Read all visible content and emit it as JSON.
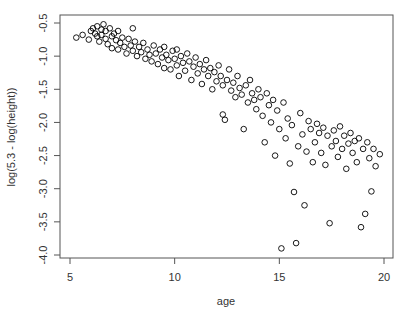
{
  "chart_data": {
    "type": "scatter",
    "title": "",
    "xlabel": "age",
    "ylabel": "log(5.3 - log(height))",
    "xlim": [
      4.75,
      20.3
    ],
    "ylim": [
      -4.05,
      -0.4
    ],
    "xticks": [
      5,
      10,
      15,
      20
    ],
    "xtick_labels": [
      "5",
      "10",
      "15",
      "20"
    ],
    "yticks": [
      -0.5,
      -1.0,
      -1.5,
      -2.0,
      -2.5,
      -3.0,
      -3.5,
      -4.0
    ],
    "ytick_labels": [
      "-0.5",
      "-1.0",
      "-1.5",
      "-2.0",
      "-2.5",
      "-3.0",
      "-3.5",
      "-4.0"
    ],
    "grid": false,
    "legend": null,
    "marker": "open-circle",
    "marker_color": "#000000",
    "trend": "decreasing, spread increases with age",
    "series": [
      {
        "name": "observations",
        "points": [
          [
            5.3,
            -0.72
          ],
          [
            5.6,
            -0.68
          ],
          [
            5.9,
            -0.75
          ],
          [
            6.0,
            -0.62
          ],
          [
            6.1,
            -0.58
          ],
          [
            6.2,
            -0.66
          ],
          [
            6.3,
            -0.55
          ],
          [
            6.3,
            -0.7
          ],
          [
            6.4,
            -0.78
          ],
          [
            6.5,
            -0.6
          ],
          [
            6.5,
            -0.68
          ],
          [
            6.6,
            -0.52
          ],
          [
            6.7,
            -0.74
          ],
          [
            6.7,
            -0.62
          ],
          [
            6.8,
            -0.82
          ],
          [
            6.9,
            -0.58
          ],
          [
            7.0,
            -0.7
          ],
          [
            7.0,
            -0.88
          ],
          [
            7.1,
            -0.66
          ],
          [
            7.2,
            -0.76
          ],
          [
            7.3,
            -0.9
          ],
          [
            7.3,
            -0.62
          ],
          [
            7.4,
            -0.8
          ],
          [
            7.5,
            -0.72
          ],
          [
            7.6,
            -0.86
          ],
          [
            7.7,
            -0.96
          ],
          [
            7.8,
            -0.74
          ],
          [
            7.9,
            -0.84
          ],
          [
            8.0,
            -0.92
          ],
          [
            8.0,
            -0.58
          ],
          [
            8.1,
            -0.78
          ],
          [
            8.2,
            -1.0
          ],
          [
            8.3,
            -0.86
          ],
          [
            8.4,
            -0.94
          ],
          [
            8.5,
            -0.8
          ],
          [
            8.6,
            -1.04
          ],
          [
            8.7,
            -0.9
          ],
          [
            8.8,
            -0.98
          ],
          [
            8.9,
            -1.08
          ],
          [
            9.0,
            -0.84
          ],
          [
            9.1,
            -0.96
          ],
          [
            9.2,
            -1.12
          ],
          [
            9.3,
            -0.9
          ],
          [
            9.4,
            -1.02
          ],
          [
            9.5,
            -1.18
          ],
          [
            9.5,
            -0.86
          ],
          [
            9.6,
            -0.98
          ],
          [
            9.7,
            -1.06
          ],
          [
            9.8,
            -1.2
          ],
          [
            9.9,
            -0.92
          ],
          [
            10.0,
            -1.04
          ],
          [
            10.1,
            -1.14
          ],
          [
            10.1,
            -0.9
          ],
          [
            10.2,
            -1.3
          ],
          [
            10.3,
            -1.0
          ],
          [
            10.4,
            -1.1
          ],
          [
            10.5,
            -1.22
          ],
          [
            10.6,
            -0.96
          ],
          [
            10.7,
            -1.08
          ],
          [
            10.8,
            -1.36
          ],
          [
            10.9,
            -1.16
          ],
          [
            11.0,
            -1.02
          ],
          [
            11.1,
            -1.26
          ],
          [
            11.2,
            -1.12
          ],
          [
            11.3,
            -1.42
          ],
          [
            11.4,
            -1.2
          ],
          [
            11.5,
            -1.06
          ],
          [
            11.6,
            -1.3
          ],
          [
            11.7,
            -1.18
          ],
          [
            11.8,
            -1.5
          ],
          [
            11.9,
            -1.24
          ],
          [
            12.0,
            -1.38
          ],
          [
            12.1,
            -1.14
          ],
          [
            12.2,
            -1.3
          ],
          [
            12.3,
            -1.44
          ],
          [
            12.3,
            -1.88
          ],
          [
            12.4,
            -1.96
          ],
          [
            12.5,
            -1.36
          ],
          [
            12.6,
            -1.2
          ],
          [
            12.7,
            -1.52
          ],
          [
            12.8,
            -1.4
          ],
          [
            12.9,
            -1.62
          ],
          [
            13.0,
            -1.3
          ],
          [
            13.1,
            -1.48
          ],
          [
            13.2,
            -1.58
          ],
          [
            13.3,
            -2.1
          ],
          [
            13.4,
            -1.44
          ],
          [
            13.5,
            -1.7
          ],
          [
            13.6,
            -1.36
          ],
          [
            13.7,
            -1.56
          ],
          [
            13.8,
            -1.66
          ],
          [
            13.9,
            -1.8
          ],
          [
            14.0,
            -1.5
          ],
          [
            14.1,
            -1.62
          ],
          [
            14.2,
            -1.9
          ],
          [
            14.3,
            -2.3
          ],
          [
            14.4,
            -1.56
          ],
          [
            14.5,
            -1.74
          ],
          [
            14.6,
            -2.0
          ],
          [
            14.7,
            -1.66
          ],
          [
            14.8,
            -2.5
          ],
          [
            14.9,
            -1.82
          ],
          [
            15.0,
            -2.1
          ],
          [
            15.1,
            -3.9
          ],
          [
            15.2,
            -1.7
          ],
          [
            15.3,
            -2.24
          ],
          [
            15.4,
            -1.94
          ],
          [
            15.5,
            -2.62
          ],
          [
            15.6,
            -2.04
          ],
          [
            15.7,
            -3.05
          ],
          [
            15.8,
            -3.82
          ],
          [
            15.9,
            -2.36
          ],
          [
            16.0,
            -1.86
          ],
          [
            16.1,
            -2.18
          ],
          [
            16.2,
            -3.25
          ],
          [
            16.3,
            -2.44
          ],
          [
            16.4,
            -1.98
          ],
          [
            16.5,
            -2.1
          ],
          [
            16.6,
            -2.6
          ],
          [
            16.7,
            -2.3
          ],
          [
            16.8,
            -2.02
          ],
          [
            16.9,
            -2.16
          ],
          [
            17.0,
            -2.46
          ],
          [
            17.1,
            -2.08
          ],
          [
            17.2,
            -2.64
          ],
          [
            17.3,
            -2.2
          ],
          [
            17.4,
            -3.52
          ],
          [
            17.5,
            -2.36
          ],
          [
            17.6,
            -2.12
          ],
          [
            17.7,
            -2.28
          ],
          [
            17.8,
            -2.52
          ],
          [
            17.9,
            -2.06
          ],
          [
            18.0,
            -2.4
          ],
          [
            18.1,
            -2.2
          ],
          [
            18.2,
            -2.7
          ],
          [
            18.3,
            -2.32
          ],
          [
            18.4,
            -2.16
          ],
          [
            18.5,
            -2.46
          ],
          [
            18.6,
            -2.28
          ],
          [
            18.7,
            -2.6
          ],
          [
            18.8,
            -2.24
          ],
          [
            18.9,
            -3.58
          ],
          [
            19.0,
            -2.4
          ],
          [
            19.1,
            -3.38
          ],
          [
            19.2,
            -2.3
          ],
          [
            19.3,
            -2.54
          ],
          [
            19.4,
            -3.04
          ],
          [
            19.5,
            -2.4
          ],
          [
            19.6,
            -2.66
          ],
          [
            19.8,
            -2.48
          ]
        ]
      }
    ]
  }
}
